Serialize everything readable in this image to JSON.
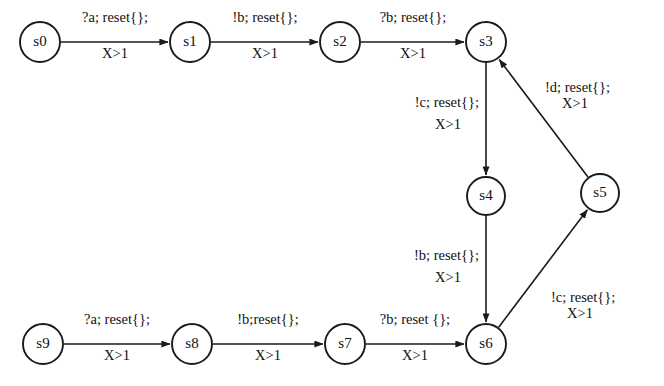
{
  "diagram": {
    "type": "timed-automaton-state-diagram",
    "background_color": "#ffffff",
    "ink_color": "#1a1a1a",
    "states": [
      {
        "id": "s0",
        "label": "s0",
        "cx": 40,
        "cy": 42,
        "r": 20
      },
      {
        "id": "s1",
        "label": "s1",
        "cx": 190,
        "cy": 42,
        "r": 20
      },
      {
        "id": "s2",
        "label": "s2",
        "cx": 340,
        "cy": 42,
        "r": 20
      },
      {
        "id": "s3",
        "label": "s3",
        "cx": 486,
        "cy": 42,
        "r": 20
      },
      {
        "id": "s4",
        "label": "s4",
        "cx": 486,
        "cy": 196,
        "r": 19
      },
      {
        "id": "s5",
        "label": "s5",
        "cx": 600,
        "cy": 193,
        "r": 19
      },
      {
        "id": "s6",
        "label": "s6",
        "cx": 486,
        "cy": 344,
        "r": 20
      },
      {
        "id": "s7",
        "label": "s7",
        "cx": 345,
        "cy": 344,
        "r": 20
      },
      {
        "id": "s8",
        "label": "s8",
        "cx": 192,
        "cy": 344,
        "r": 20
      },
      {
        "id": "s9",
        "label": "s9",
        "cx": 43,
        "cy": 344,
        "r": 20
      }
    ],
    "transitions": [
      {
        "id": "t-s0-s1",
        "from": "s0",
        "to": "s1",
        "action": "?a; reset{};",
        "guard": "X>1",
        "label_x": 115,
        "label_y": 22,
        "guard_x": 115,
        "guard_y": 58,
        "align": "center"
      },
      {
        "id": "t-s1-s2",
        "from": "s1",
        "to": "s2",
        "action": "!b; reset{};",
        "guard": "X>1",
        "label_x": 265,
        "label_y": 22,
        "guard_x": 265,
        "guard_y": 58,
        "align": "center"
      },
      {
        "id": "t-s2-s3",
        "from": "s2",
        "to": "s3",
        "action": "?b; reset{};",
        "guard": "X>1",
        "label_x": 413,
        "label_y": 22,
        "guard_x": 413,
        "guard_y": 58,
        "align": "center"
      },
      {
        "id": "t-s3-s4",
        "from": "s3",
        "to": "s4",
        "action": "!c; reset{};",
        "guard": "X>1",
        "label_x": 479,
        "label_y": 107,
        "guard_x": 448,
        "guard_y": 129,
        "align": "end"
      },
      {
        "id": "t-s4-s6",
        "from": "s4",
        "to": "s6",
        "action": "!b; reset{};",
        "guard": "X>1",
        "label_x": 479,
        "label_y": 260,
        "guard_x": 448,
        "guard_y": 282,
        "align": "end"
      },
      {
        "id": "t-s6-s5",
        "from": "s6",
        "to": "s5",
        "action": "!c; reset{};",
        "guard": "X>1",
        "label_x": 551,
        "label_y": 302,
        "guard_x": 580,
        "guard_y": 318,
        "align": "start"
      },
      {
        "id": "t-s5-s3",
        "from": "s5",
        "to": "s3",
        "action": "!d; reset{};",
        "guard": "X>1",
        "label_x": 545,
        "label_y": 92,
        "guard_x": 575,
        "guard_y": 108,
        "align": "start"
      },
      {
        "id": "t-s9-s8",
        "from": "s9",
        "to": "s8",
        "action": "?a; reset{};",
        "guard": "X>1",
        "label_x": 117,
        "label_y": 324,
        "guard_x": 117,
        "guard_y": 360,
        "align": "center"
      },
      {
        "id": "t-s8-s7",
        "from": "s8",
        "to": "s7",
        "action": "!b;reset{};",
        "guard": "X>1",
        "label_x": 268,
        "label_y": 324,
        "guard_x": 268,
        "guard_y": 360,
        "align": "center"
      },
      {
        "id": "t-s7-s6",
        "from": "s7",
        "to": "s6",
        "action": "?b; reset {};",
        "guard": "X>1",
        "label_x": 415,
        "label_y": 324,
        "guard_x": 415,
        "guard_y": 360,
        "align": "center"
      }
    ]
  }
}
